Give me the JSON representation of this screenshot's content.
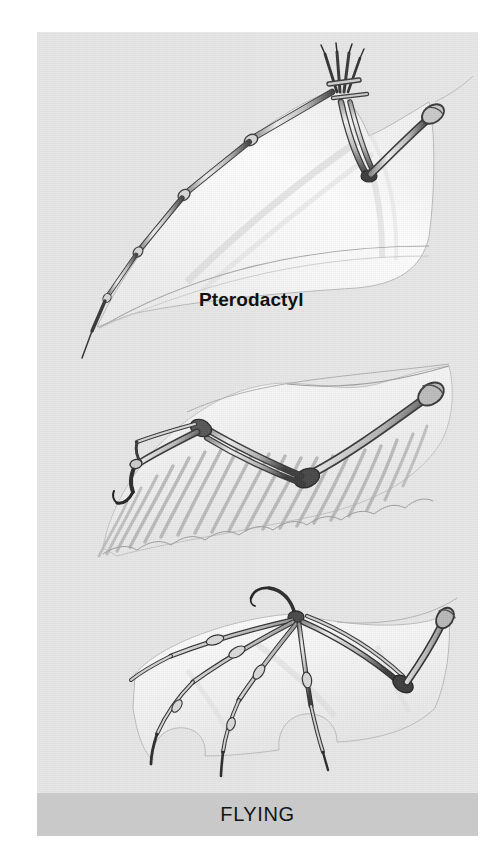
{
  "figure": {
    "category_label": "FLYING",
    "background_color": "#ffffff",
    "plate_color": "#e7e7e7",
    "category_bar_color": "#c9c9c9",
    "label_color": "#111111",
    "ink_color": "#3a3a3a",
    "membrane_color": "#f4f4f4",
    "medium": "pencil drawing"
  },
  "specimens": [
    {
      "id": "pterodactyl",
      "label": "Pterodactyl",
      "order": 1,
      "wing_type": "skin membrane supported by one elongated finger",
      "visible_elements": [
        "humerus",
        "radius-ulna",
        "short clawed fingers",
        "elongated fourth finger",
        "skin membrane"
      ]
    },
    {
      "id": "bird",
      "label": "Bird",
      "order": 2,
      "wing_type": "feathered wing with fused hand bones",
      "visible_elements": [
        "humerus",
        "radius-ulna",
        "carpometacarpus",
        "alula claw",
        "flight feathers"
      ]
    },
    {
      "id": "bat",
      "label": "Bat",
      "order": 3,
      "wing_type": "skin membrane stretched across four elongated fingers",
      "visible_elements": [
        "humerus",
        "radius-ulna",
        "thumb claw",
        "four elongated fingers",
        "skin membrane"
      ]
    }
  ]
}
